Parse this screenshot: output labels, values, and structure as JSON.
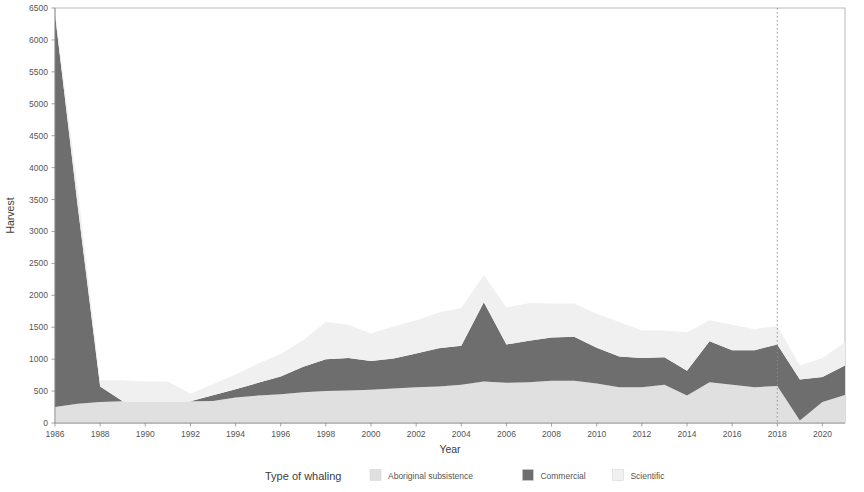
{
  "chart_data": {
    "type": "area",
    "stacked": true,
    "title": "",
    "xlabel": "Year",
    "ylabel": "Harvest",
    "xlim": [
      1986,
      2021
    ],
    "ylim": [
      0,
      6500
    ],
    "grid": false,
    "legend_position": "bottom",
    "legend_title": "Type of whaling",
    "x_tick_labels": [
      "1986",
      "1988",
      "1990",
      "1992",
      "1994",
      "1996",
      "1998",
      "2000",
      "2002",
      "2004",
      "2006",
      "2008",
      "2010",
      "2012",
      "2014",
      "2016",
      "2018",
      "2020"
    ],
    "x_tick_values": [
      1986,
      1988,
      1990,
      1992,
      1994,
      1996,
      1998,
      2000,
      2002,
      2004,
      2006,
      2008,
      2010,
      2012,
      2014,
      2016,
      2018,
      2020
    ],
    "y_tick_labels": [
      "0",
      "500",
      "1000",
      "1500",
      "2000",
      "2500",
      "3000",
      "3500",
      "4000",
      "4500",
      "5000",
      "5500",
      "6000",
      "6500"
    ],
    "y_tick_values": [
      0,
      500,
      1000,
      1500,
      2000,
      2500,
      3000,
      3500,
      4000,
      4500,
      5000,
      5500,
      6000,
      6500
    ],
    "x": [
      1986,
      1987,
      1988,
      1989,
      1990,
      1991,
      1992,
      1993,
      1994,
      1995,
      1996,
      1997,
      1998,
      1999,
      2000,
      2001,
      2002,
      2003,
      2004,
      2005,
      2006,
      2007,
      2008,
      2009,
      2010,
      2011,
      2012,
      2013,
      2014,
      2015,
      2016,
      2017,
      2018,
      2019,
      2020,
      2021
    ],
    "annotations": [
      {
        "type": "vline",
        "x": 2018,
        "style": "dotted",
        "color": "#8c8c8c"
      }
    ],
    "series": [
      {
        "name": "Aboriginal subsistence",
        "color": "#e0e0e0",
        "stack_order": 1,
        "values": [
          250,
          300,
          330,
          340,
          330,
          330,
          340,
          345,
          400,
          430,
          450,
          480,
          500,
          510,
          520,
          540,
          560,
          570,
          600,
          650,
          630,
          640,
          660,
          660,
          620,
          560,
          560,
          600,
          430,
          640,
          600,
          560,
          580,
          40,
          330,
          440
        ]
      },
      {
        "name": "Commercial",
        "color": "#6e6e6e",
        "stack_order": 2,
        "values": [
          6150,
          3120,
          240,
          0,
          0,
          0,
          0,
          90,
          130,
          200,
          280,
          400,
          500,
          510,
          450,
          470,
          530,
          600,
          610,
          1240,
          600,
          650,
          680,
          690,
          560,
          480,
          460,
          430,
          390,
          640,
          540,
          580,
          650,
          640,
          390,
          460
        ]
      },
      {
        "name": "Scientific",
        "color": "#f0f0f0",
        "stack_order": 3,
        "values": [
          50,
          280,
          100,
          330,
          320,
          320,
          120,
          170,
          230,
          300,
          350,
          420,
          580,
          520,
          430,
          500,
          520,
          560,
          590,
          430,
          580,
          590,
          530,
          520,
          530,
          540,
          430,
          420,
          600,
          330,
          400,
          330,
          290,
          220,
          300,
          370
        ]
      }
    ]
  },
  "legend": {
    "title": "Type of whaling",
    "items": [
      {
        "label": "Aboriginal subsistence",
        "color": "#e0e0e0"
      },
      {
        "label": "Commercial",
        "color": "#6e6e6e"
      },
      {
        "label": "Scientific",
        "color": "#f0f0f0"
      }
    ]
  },
  "axes": {
    "y_title": "Harvest",
    "x_title": "Year"
  }
}
